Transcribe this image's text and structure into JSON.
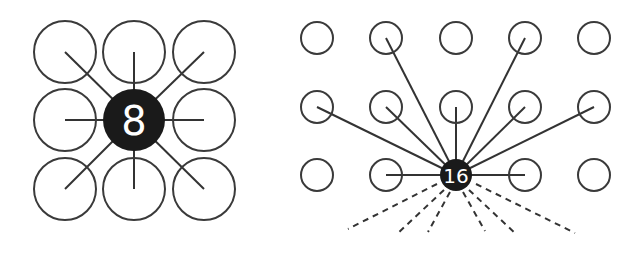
{
  "left_diagram": {
    "hub_label": "8",
    "grid": {
      "rows": 3,
      "cols": 3
    },
    "connections": 8
  },
  "right_diagram": {
    "hub_label": "16",
    "grid": {
      "rows": 3,
      "cols": 5
    },
    "solid_connections": 10,
    "dashed_connections": 6
  },
  "colors": {
    "stroke": "#3a3a3a",
    "hub": "#1a1a1a",
    "hub_text": "#ffffff",
    "background": "#ffffff"
  }
}
